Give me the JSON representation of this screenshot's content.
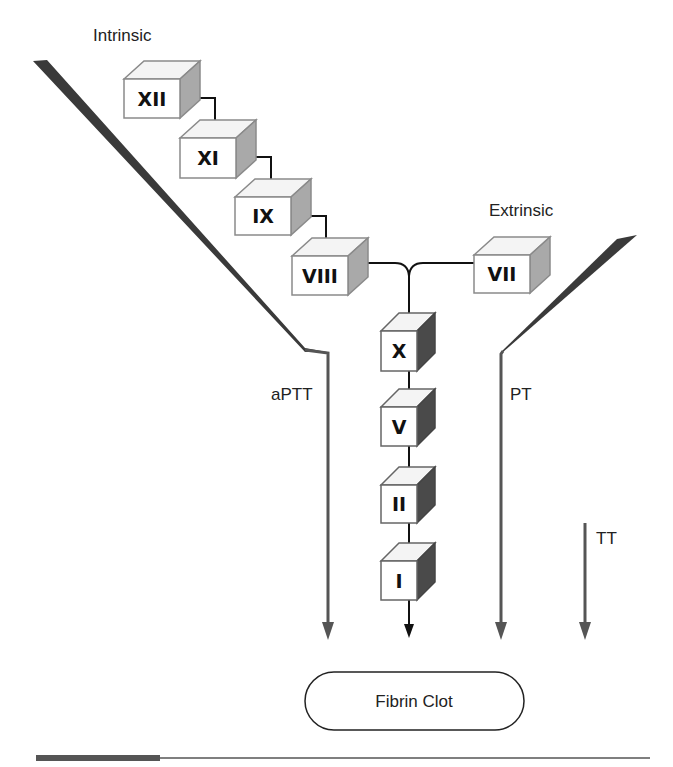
{
  "pathways": {
    "intrinsic": {
      "label": "Intrinsic"
    },
    "extrinsic": {
      "label": "Extrinsic"
    }
  },
  "tests": {
    "aptt": {
      "label": "aPTT"
    },
    "pt": {
      "label": "PT"
    },
    "tt": {
      "label": "TT"
    }
  },
  "factors": {
    "intrinsic": [
      {
        "label": "XII"
      },
      {
        "label": "XI"
      },
      {
        "label": "IX"
      },
      {
        "label": "VIII"
      }
    ],
    "extrinsic": [
      {
        "label": "VII"
      }
    ],
    "common": [
      {
        "label": "X"
      },
      {
        "label": "V"
      },
      {
        "label": "II"
      },
      {
        "label": "I"
      }
    ]
  },
  "outcome": {
    "label": "Fibrin Clot"
  },
  "colors": {
    "cube_front": "#ffffff",
    "cube_top": "#f4f4f4",
    "cube_side_light": "#a9a9a9",
    "cube_side_dark": "#4a4a4a",
    "cube_edge": "#8a8a8a",
    "wedge": "#3a3a3a",
    "test_line": "#555555",
    "connector": "#111111"
  }
}
